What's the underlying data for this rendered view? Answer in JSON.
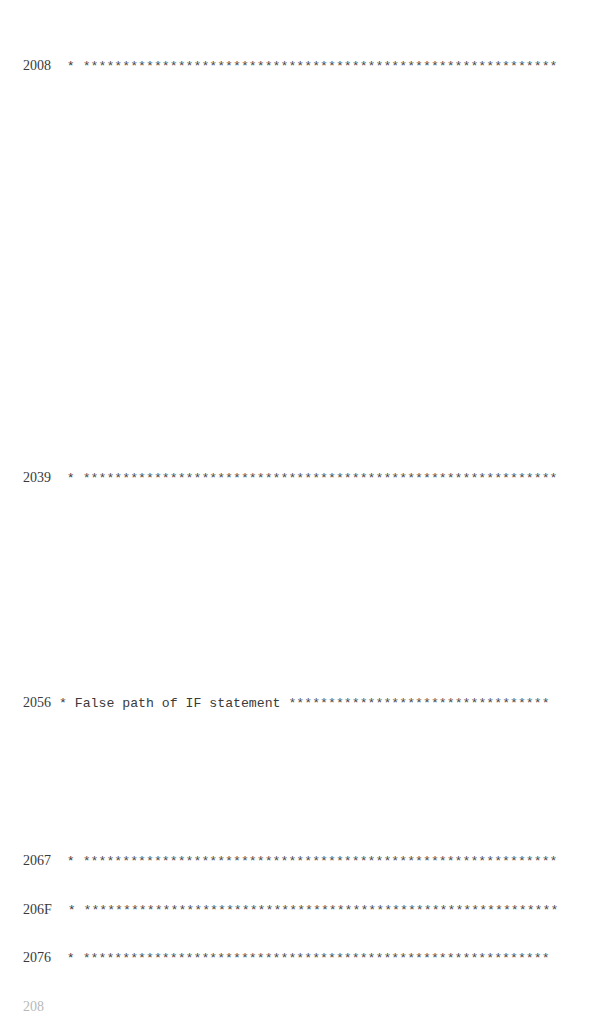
{
  "document": {
    "lines": [
      {
        "address": "2008",
        "marker": "*",
        "comment": "",
        "stars": "************************************************************",
        "top": 58
      },
      {
        "address": "2039",
        "marker": "*",
        "comment": "",
        "stars": "************************************************************",
        "top": 470
      },
      {
        "address": "2056",
        "marker": "*",
        "comment": "False path of IF statement",
        "stars": "*********************************",
        "top": 695
      },
      {
        "address": "2067",
        "marker": "*",
        "comment": "",
        "stars": "************************************************************",
        "top": 853
      },
      {
        "address": "206F",
        "marker": "*",
        "comment": "",
        "stars": "************************************************************",
        "top": 902
      },
      {
        "address": "2076",
        "marker": "*",
        "comment": "",
        "stars": "***********************************************************",
        "top": 950
      }
    ],
    "partial_line": "208"
  }
}
